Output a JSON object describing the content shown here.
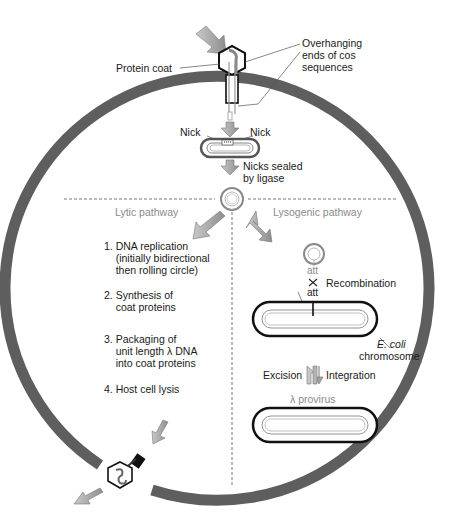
{
  "labels": {
    "protein_coat": "Protein coat",
    "cos_ends": "Overhanging\nends of cos\nsequences",
    "nick_left": "Nick",
    "nick_right": "Nick",
    "nicks_sealed": "Nicks sealed\nby ligase",
    "lytic_pathway": "Lytic pathway",
    "lysogenic_pathway": "Lysogenic pathway",
    "att_phage": "att",
    "att_bacterial": "att",
    "recombination": "Recombination",
    "ecoli": "E. coli",
    "chromosome": "chromosome",
    "excision": "Excision",
    "integration": "Integration",
    "provirus": "λ provirus"
  },
  "lytic_steps": [
    {
      "num": "1.",
      "text": "DNA replication\n(initially bidirectional\nthen rolling circle)"
    },
    {
      "num": "2.",
      "text": "Synthesis of\ncoat proteins"
    },
    {
      "num": "3.",
      "text": "Packaging of\nunit length λ DNA\ninto coat proteins"
    },
    {
      "num": "4.",
      "text": "Host cell lysis"
    }
  ],
  "colors": {
    "cell_wall": "#5e5e5e",
    "arrow_fill": "#a9a9a9",
    "pale_text": "#8a8a8a",
    "dna_dark": "#111111"
  }
}
